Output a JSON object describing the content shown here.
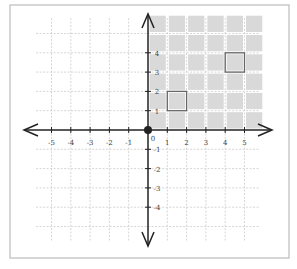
{
  "figure": {
    "type": "coordinate-plane",
    "origin_label": "0",
    "x_tick_labels": [
      "-5",
      "-4",
      "-3",
      "-2",
      "-1",
      "1",
      "2",
      "3",
      "4",
      "5"
    ],
    "y_tick_labels": [
      "4",
      "3",
      "2",
      "1",
      "-1",
      "-2",
      "-3",
      "-4"
    ],
    "shaded_region": {
      "x_from": 0,
      "x_to": 6,
      "y_from": 0,
      "y_to": 6,
      "cells": 36
    },
    "highlighted_squares": [
      {
        "x": 1,
        "y": 1,
        "width": 1,
        "height": 1
      },
      {
        "x": 4,
        "y": 3,
        "width": 1,
        "height": 1
      }
    ],
    "colors": {
      "axis": "#222222",
      "grid": "#cccccc",
      "shade": "#d9d9d9",
      "highlight_border": "#666666",
      "frame": "#bbbbbb"
    }
  }
}
